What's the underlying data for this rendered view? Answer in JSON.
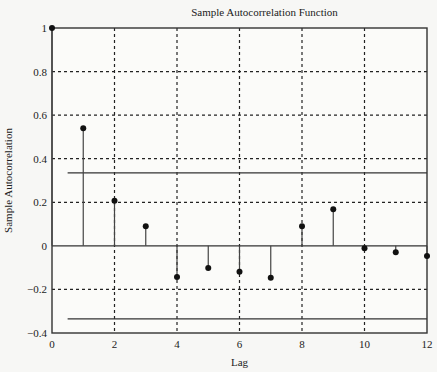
{
  "chart_data": {
    "type": "stem",
    "title": "Sample Autocorrelation Function",
    "xlabel": "Lag",
    "ylabel": "Sample Autocorrelation",
    "xlim": [
      0,
      12
    ],
    "ylim": [
      -0.4,
      1
    ],
    "xticks": [
      0,
      2,
      4,
      6,
      8,
      10,
      12
    ],
    "xtick_labels": [
      "0",
      "2",
      "4",
      "6",
      "8",
      "10",
      "12"
    ],
    "yticks": [
      -0.4,
      -0.2,
      0,
      0.2,
      0.4,
      0.6,
      0.8,
      1
    ],
    "ytick_labels": [
      "-0.4",
      "-0.2",
      "0",
      "0.2",
      "0.4",
      "0.6",
      "0.8",
      "1"
    ],
    "grid": true,
    "x": [
      0,
      1,
      2,
      3,
      4,
      5,
      6,
      7,
      8,
      9,
      10,
      11,
      12
    ],
    "values": [
      1.0,
      0.54,
      0.207,
      0.09,
      -0.143,
      -0.102,
      -0.119,
      -0.146,
      0.09,
      0.168,
      -0.011,
      -0.029,
      -0.046
    ],
    "confidence_bounds": {
      "upper": 0.335,
      "lower": -0.335,
      "x_start": 0.5,
      "x_end": 12
    },
    "colors": {
      "stem": "#444444",
      "marker": "#111111",
      "grid": "#222222",
      "axes": "#333333"
    }
  }
}
